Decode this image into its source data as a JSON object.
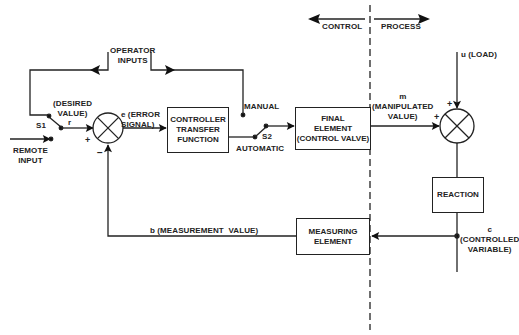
{
  "diagram": {
    "type": "feedback control loop block diagram",
    "header": {
      "control_label": "CONTROL",
      "process_label": "PROCESS"
    },
    "blocks": {
      "controller": "CONTROLLER\nTRANSFER\nFUNCTION",
      "final_element": "FINAL\nELEMENT\n(CONTROL VALVE)",
      "reaction": "REACTION",
      "measuring_element": "MEASURING\nELEMENT"
    },
    "labels": {
      "operator_inputs": "OPERATOR\nINPUTS",
      "desired_value": "(DESIRED\nVALUE)",
      "r": "r",
      "s1": "S1",
      "remote_input": "REMOTE\nINPUT",
      "error_signal": "e (ERROR\nSIGNAL)",
      "manual": "MANUAL",
      "automatic": "AUTOMATIC",
      "s2": "S2",
      "manipulated_value": "m\n(MANIPULATED\nVALUE)",
      "load": "u (LOAD)",
      "controlled_variable": "c\n(CONTROLLED\nVARIABLE)",
      "measurement_value": "b (MEASUREMENT  VALUE)",
      "plus_1": "+",
      "minus_1": "−",
      "plus_2": "+",
      "plus_3": "+"
    }
  }
}
